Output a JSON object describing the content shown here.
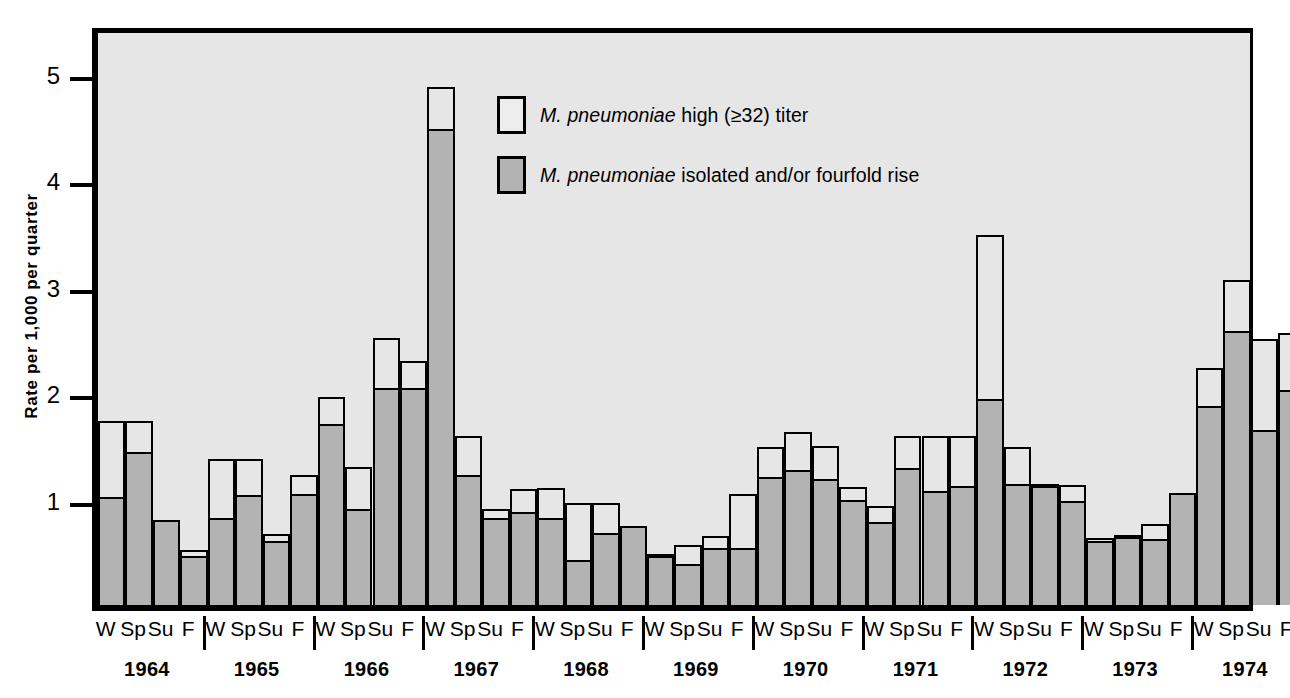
{
  "chart_data": {
    "type": "bar",
    "title": "",
    "subtitle": "",
    "xlabel": "",
    "ylabel": "Rate per 1,000 per quarter",
    "ylim": [
      0,
      5.47
    ],
    "yticks": [
      1,
      2,
      3,
      4,
      5
    ],
    "ytick_labels": [
      "1",
      "2",
      "3",
      "4",
      "5"
    ],
    "grid": false,
    "stacked": true,
    "legend_position": "inside-top-center",
    "quarter_labels": [
      "W",
      "Sp",
      "Su",
      "F"
    ],
    "years": [
      "1964",
      "1965",
      "1966",
      "1967",
      "1968",
      "1969",
      "1970",
      "1971",
      "1972",
      "1973",
      "1974",
      "1975"
    ],
    "series": [
      {
        "name": "M. pneumoniae isolated and/or fourfold rise",
        "color": "#b3b3b3",
        "values": [
          1.0,
          1.42,
          0.8,
          0.44,
          0.8,
          1.01,
          0.58,
          1.02,
          1.68,
          0.88,
          2.02,
          2.02,
          4.45,
          1.2,
          0.8,
          0.85,
          0.8,
          0.4,
          0.66,
          0.74,
          0.44,
          0.37,
          0.52,
          0.52,
          1.18,
          1.25,
          1.16,
          0.97,
          0.76,
          1.27,
          1.05,
          1.1,
          1.92,
          1.12,
          1.12,
          0.96,
          0.58,
          0.62,
          0.6,
          1.05,
          1.85,
          2.55,
          1.62,
          2.0
        ]
      },
      {
        "name": "M. pneumoniae high (≥32) titer",
        "color": "#e6e6e6",
        "values": [
          0.73,
          0.31,
          0.0,
          0.08,
          0.57,
          0.36,
          0.09,
          0.2,
          0.27,
          0.42,
          0.49,
          0.27,
          0.41,
          0.39,
          0.1,
          0.24,
          0.3,
          0.56,
          0.3,
          0.0,
          0.04,
          0.19,
          0.13,
          0.52,
          0.3,
          0.37,
          0.33,
          0.14,
          0.17,
          0.32,
          0.54,
          0.49,
          1.55,
          0.36,
          0.02,
          0.17,
          0.05,
          0.04,
          0.16,
          0.0,
          0.38,
          0.5,
          0.88,
          0.55
        ]
      }
    ],
    "totals": [
      1.73,
      1.73,
      0.8,
      0.52,
      1.37,
      1.37,
      0.67,
      1.22,
      1.95,
      1.3,
      2.51,
      2.29,
      4.86,
      1.59,
      0.9,
      1.09,
      1.1,
      0.96,
      0.96,
      0.74,
      0.48,
      0.56,
      0.65,
      1.04,
      1.48,
      1.62,
      1.49,
      1.11,
      0.93,
      1.59,
      1.59,
      1.59,
      3.47,
      1.48,
      1.14,
      1.13,
      0.63,
      0.66,
      0.76,
      1.05,
      2.23,
      3.05,
      2.5,
      2.55
    ],
    "bars": [
      {
        "year": "1964",
        "quarter": "W",
        "gray": 1.0,
        "white": 0.73,
        "total": 1.73
      },
      {
        "year": "1964",
        "quarter": "Sp",
        "gray": 1.42,
        "white": 0.31,
        "total": 1.73
      },
      {
        "year": "1964",
        "quarter": "Su",
        "gray": 0.8,
        "white": 0.0,
        "total": 0.8
      },
      {
        "year": "1964",
        "quarter": "F",
        "gray": 0.44,
        "white": 0.08,
        "total": 0.52
      },
      {
        "year": "1965",
        "quarter": "W",
        "gray": 0.8,
        "white": 0.57,
        "total": 1.37
      },
      {
        "year": "1965",
        "quarter": "Sp",
        "gray": 1.01,
        "white": 0.36,
        "total": 1.37
      },
      {
        "year": "1965",
        "quarter": "Su",
        "gray": 0.58,
        "white": 0.09,
        "total": 0.67
      },
      {
        "year": "1965",
        "quarter": "F",
        "gray": 1.02,
        "white": 0.2,
        "total": 1.22
      },
      {
        "year": "1966",
        "quarter": "W",
        "gray": 1.68,
        "white": 0.27,
        "total": 1.95
      },
      {
        "year": "1966",
        "quarter": "Sp",
        "gray": 0.88,
        "white": 0.42,
        "total": 1.3
      },
      {
        "year": "1966",
        "quarter": "Su",
        "gray": 2.02,
        "white": 0.49,
        "total": 2.51
      },
      {
        "year": "1966",
        "quarter": "F",
        "gray": 2.02,
        "white": 0.27,
        "total": 2.29
      },
      {
        "year": "1967",
        "quarter": "W",
        "gray": 4.45,
        "white": 0.41,
        "total": 4.86
      },
      {
        "year": "1967",
        "quarter": "Sp",
        "gray": 1.2,
        "white": 0.39,
        "total": 1.59
      },
      {
        "year": "1967",
        "quarter": "Su",
        "gray": 0.8,
        "white": 0.1,
        "total": 0.9
      },
      {
        "year": "1967",
        "quarter": "F",
        "gray": 0.85,
        "white": 0.24,
        "total": 1.09
      },
      {
        "year": "1968",
        "quarter": "W",
        "gray": 0.8,
        "white": 0.3,
        "total": 1.1
      },
      {
        "year": "1968",
        "quarter": "Sp",
        "gray": 0.4,
        "white": 0.56,
        "total": 0.96
      },
      {
        "year": "1968",
        "quarter": "Su",
        "gray": 0.66,
        "white": 0.3,
        "total": 0.96
      },
      {
        "year": "1968",
        "quarter": "F",
        "gray": 0.74,
        "white": 0.0,
        "total": 0.74
      },
      {
        "year": "1969",
        "quarter": "W",
        "gray": 0.44,
        "white": 0.04,
        "total": 0.48
      },
      {
        "year": "1969",
        "quarter": "Sp",
        "gray": 0.37,
        "white": 0.19,
        "total": 0.56
      },
      {
        "year": "1969",
        "quarter": "Su",
        "gray": 0.52,
        "white": 0.13,
        "total": 0.65
      },
      {
        "year": "1969",
        "quarter": "F",
        "gray": 0.52,
        "white": 0.52,
        "total": 1.04
      },
      {
        "year": "1970",
        "quarter": "W",
        "gray": 1.18,
        "white": 0.3,
        "total": 1.48
      },
      {
        "year": "1970",
        "quarter": "Sp",
        "gray": 1.25,
        "white": 0.37,
        "total": 1.62
      },
      {
        "year": "1970",
        "quarter": "Su",
        "gray": 1.16,
        "white": 0.33,
        "total": 1.49
      },
      {
        "year": "1970",
        "quarter": "F",
        "gray": 0.97,
        "white": 0.14,
        "total": 1.11
      },
      {
        "year": "1971",
        "quarter": "W",
        "gray": 0.76,
        "white": 0.17,
        "total": 0.93
      },
      {
        "year": "1971",
        "quarter": "Sp",
        "gray": 1.27,
        "white": 0.32,
        "total": 1.59
      },
      {
        "year": "1971",
        "quarter": "Su",
        "gray": 1.05,
        "white": 0.54,
        "total": 1.59
      },
      {
        "year": "1971",
        "quarter": "F",
        "gray": 1.1,
        "white": 0.49,
        "total": 1.59
      },
      {
        "year": "1972",
        "quarter": "W",
        "gray": 1.92,
        "white": 1.55,
        "total": 3.47
      },
      {
        "year": "1972",
        "quarter": "Sp",
        "gray": 1.12,
        "white": 0.36,
        "total": 1.48
      },
      {
        "year": "1972",
        "quarter": "Su",
        "gray": 1.12,
        "white": 0.02,
        "total": 1.14
      },
      {
        "year": "1972",
        "quarter": "F",
        "gray": 0.96,
        "white": 0.17,
        "total": 1.13
      },
      {
        "year": "1973",
        "quarter": "W",
        "gray": 0.58,
        "white": 0.05,
        "total": 0.63
      },
      {
        "year": "1973",
        "quarter": "Sp",
        "gray": 0.62,
        "white": 0.04,
        "total": 0.66
      },
      {
        "year": "1973",
        "quarter": "Su",
        "gray": 0.6,
        "white": 0.16,
        "total": 0.76
      },
      {
        "year": "1973",
        "quarter": "F",
        "gray": 1.05,
        "white": 0.0,
        "total": 1.05
      },
      {
        "year": "1974",
        "quarter": "W",
        "gray": 1.85,
        "white": 0.38,
        "total": 2.23
      },
      {
        "year": "1974",
        "quarter": "Sp",
        "gray": 2.55,
        "white": 0.5,
        "total": 3.05
      },
      {
        "year": "1974",
        "quarter": "Su",
        "gray": 1.62,
        "white": 0.88,
        "total": 2.5
      },
      {
        "year": "1975",
        "quarter": "W",
        "gray": 2.0,
        "white": 0.55,
        "total": 2.55
      }
    ]
  },
  "legend": {
    "items": [
      {
        "swatch": "open",
        "prefix": "M. ",
        "species": "pneumoniae",
        "suffix": " high (≥32) titer"
      },
      {
        "swatch": "filled",
        "prefix": "M. ",
        "species": "pneumoniae",
        "suffix": " isolated and/or fourfold rise"
      }
    ]
  }
}
